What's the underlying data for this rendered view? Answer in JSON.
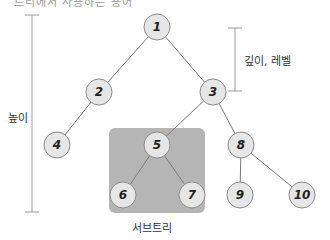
{
  "top_text_fragment": "트리에서 사용하는 용어",
  "labels": {
    "height": "높이",
    "depth_level": "깊이, 레벨",
    "subtree": "서브트리"
  },
  "colors": {
    "node_fill": "#e6e6e6",
    "node_stroke": "#8c8c8c",
    "edge": "#7a7a7a",
    "subtree_box": "#b5b5b5",
    "bracket": "#9a9a9a"
  },
  "tree": {
    "nodes": [
      {
        "id": "1",
        "label": "1"
      },
      {
        "id": "2",
        "label": "2"
      },
      {
        "id": "3",
        "label": "3"
      },
      {
        "id": "4",
        "label": "4"
      },
      {
        "id": "5",
        "label": "5"
      },
      {
        "id": "8",
        "label": "8"
      },
      {
        "id": "6",
        "label": "6"
      },
      {
        "id": "7",
        "label": "7"
      },
      {
        "id": "9",
        "label": "9"
      },
      {
        "id": "10",
        "label": "10"
      }
    ],
    "edges": [
      [
        "1",
        "2"
      ],
      [
        "1",
        "3"
      ],
      [
        "2",
        "4"
      ],
      [
        "3",
        "5"
      ],
      [
        "3",
        "8"
      ],
      [
        "5",
        "6"
      ],
      [
        "5",
        "7"
      ],
      [
        "8",
        "9"
      ],
      [
        "8",
        "10"
      ]
    ],
    "subtree_root": "5"
  }
}
